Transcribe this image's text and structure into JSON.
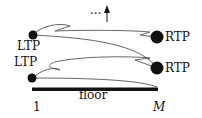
{
  "diagram": {
    "labels": {
      "ltp_upper": "LTP",
      "ltp_lower": "LTP",
      "rtp_upper": "RTP",
      "rtp_lower": "RTP",
      "floor": "floor",
      "left_index": "1",
      "right_index": "M",
      "continuation": "···"
    },
    "colors": {
      "ink": "#111111",
      "curve": "#555555",
      "background": "#ffffff"
    }
  }
}
